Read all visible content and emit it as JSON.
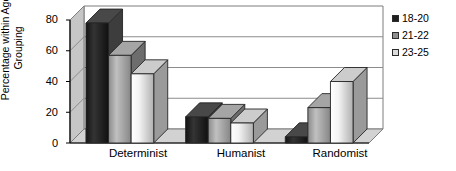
{
  "chart_data": {
    "type": "bar",
    "title": "",
    "subtitle": "",
    "xlabel": "",
    "ylabel": "Percentage within Age Grouping",
    "ylabel_line1": "Percentage within Age",
    "ylabel_line2": "Grouping",
    "categories": [
      "Determinist",
      "Humanist",
      "Randomist"
    ],
    "series": [
      {
        "name": "18-20",
        "values": [
          78,
          17,
          4
        ],
        "color": "#1f1f1f"
      },
      {
        "name": "21-22",
        "values": [
          57,
          16,
          23
        ],
        "color": "#9a9a9a"
      },
      {
        "name": "23-25",
        "values": [
          45,
          13,
          40
        ],
        "color": "#eeeeee"
      }
    ],
    "yticks": [
      0,
      20,
      40,
      60,
      80
    ],
    "ytick_labels": [
      "0",
      "20",
      "40",
      "60",
      "80"
    ],
    "ylim": [
      0,
      80
    ],
    "grid": true,
    "grid_axis": "y",
    "legend_position": "right",
    "style_3d": true
  },
  "legend": {
    "entries": [
      {
        "label": "18-20",
        "swatch": "#1f1f1f"
      },
      {
        "label": "21-22",
        "swatch": "#8f8f8f"
      },
      {
        "label": "23-25",
        "swatch": "#dcdcdc"
      }
    ]
  },
  "axes": {
    "y_title_line1": "Percentage within Age",
    "y_title_line2": "Grouping",
    "y_tick_80": "80",
    "y_tick_60": "60",
    "y_tick_40": "40",
    "y_tick_20": "20",
    "y_tick_0": "0",
    "x_cat_0": "Determinist",
    "x_cat_1": "Humanist",
    "x_cat_2": "Randomist"
  },
  "colors": {
    "background": "#ffffff",
    "axis": "#000000",
    "gridline": "#8c8c8c",
    "wall": "#c9c9c9",
    "floor": "#d0d0d0"
  }
}
